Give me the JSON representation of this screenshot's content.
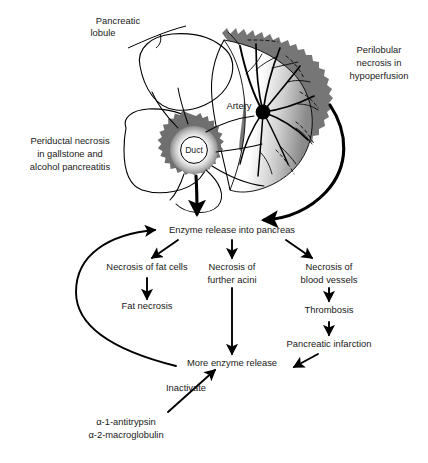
{
  "figure": {
    "background_color": "#ffffff",
    "ink_color": "#000000",
    "necrosis_fill_color": "#767676",
    "width": 428,
    "height": 463
  },
  "anatomy": {
    "labels": {
      "pancreatic_lobule": "Pancreatic\nlobule",
      "pancreatic_lobule_line1": "Pancreatic",
      "pancreatic_lobule_line2": "lobule",
      "perilobular_line1": "Perilobular",
      "perilobular_line2": "necrosis in",
      "perilobular_line3": "hypoperfusion",
      "periductal_line1": "Periductal necrosis",
      "periductal_line2": "in gallstone and",
      "periductal_line3": "alcohol pancreatitis",
      "artery": "Artery",
      "duct": "Duct"
    }
  },
  "flowchart": {
    "nodes": {
      "enzyme_release": "Enzyme release into pancreas",
      "necrosis_fat_cells": "Necrosis of fat cells",
      "necrosis_further_acini_line1": "Necrosis of",
      "necrosis_further_acini_line2": "further acini",
      "necrosis_blood_vessels_line1": "Necrosis of",
      "necrosis_blood_vessels_line2": "blood vessels",
      "fat_necrosis": "Fat necrosis",
      "thrombosis": "Thrombosis",
      "pancreatic_infarction": "Pancreatic infarction",
      "more_enzyme_release": "More enzyme release",
      "inactivate": "Inactivate",
      "inhibitor_line1": "α-1-antitrypsin",
      "inhibitor_line2": "α-2-macroglobulin"
    }
  }
}
